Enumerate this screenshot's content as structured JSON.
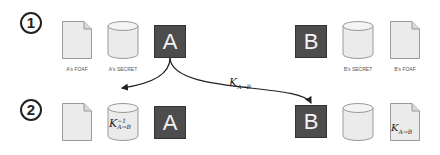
{
  "steps": [
    "1",
    "2"
  ],
  "row1": {
    "a_doc_caption": "A's FOAF",
    "a_cyl_caption": "A's SECRET",
    "a_box_label": "A",
    "b_box_label": "B",
    "b_cyl_caption": "B's SECRET",
    "b_doc_caption": "B's FOAF"
  },
  "row2": {
    "a_cyl_key": {
      "base": "K",
      "sub": "A→B",
      "sup": "−1"
    },
    "a_box_label": "A",
    "b_box_label": "B",
    "b_doc_key": {
      "base": "K",
      "sub": "A→B"
    }
  },
  "arrow_label": {
    "base": "K",
    "sub": "A→B"
  },
  "colors": {
    "box_fill": "#4d4d4d",
    "doc_fill": "#ebebeb",
    "line": "#222222"
  }
}
